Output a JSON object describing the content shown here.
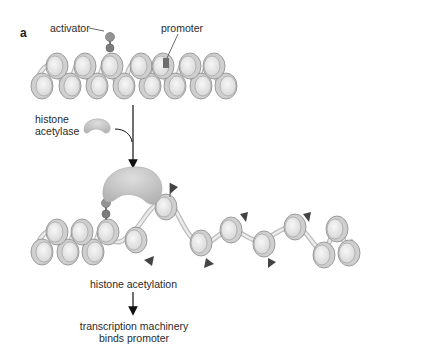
{
  "figure": {
    "panel_label": "a",
    "labels": {
      "activator": "activator",
      "promoter": "promoter",
      "histone_acetylase_line1": "histone",
      "histone_acetylase_line2": "acetylase",
      "histone_acetylation": "histone acetylation",
      "result_line1": "transcription machinery",
      "result_line2": "binds promoter"
    },
    "colors": {
      "nucleosome_fill": "#e6e6e6",
      "nucleosome_edge": "#8a8a8a",
      "activator": "#8e8e8e",
      "promoter": "#6e6e6e",
      "acetylase": "#c4c4c4",
      "acetyl_flag": "#444444",
      "arrow": "#111111"
    },
    "top_row": {
      "state": "condensed chromatin",
      "upper_nucleosomes_x": [
        55,
        83,
        110,
        139,
        161,
        188,
        212
      ],
      "lower_nucleosomes_x": [
        42,
        70,
        97,
        124,
        150,
        175,
        201,
        226
      ],
      "upper_y": 67,
      "lower_y": 86
    },
    "bottom_row": {
      "state": "acetylated, open chromatin",
      "condensed_upper_x": [
        55,
        80,
        106
      ],
      "condensed_lower_x": [
        42,
        68,
        93
      ],
      "open_nucleosomes": [
        {
          "x": 136,
          "y": 229
        },
        {
          "x": 164,
          "y": 201
        },
        {
          "x": 200,
          "y": 243
        },
        {
          "x": 229,
          "y": 230
        },
        {
          "x": 263,
          "y": 240
        },
        {
          "x": 294,
          "y": 226
        },
        {
          "x": 322,
          "y": 250
        },
        {
          "x": 337,
          "y": 226
        },
        {
          "x": 347,
          "y": 253
        }
      ],
      "acetyl_flags": [
        {
          "x": 172,
          "y": 185
        },
        {
          "x": 146,
          "y": 260
        },
        {
          "x": 206,
          "y": 264
        },
        {
          "x": 244,
          "y": 215
        },
        {
          "x": 272,
          "y": 262
        },
        {
          "x": 307,
          "y": 213
        }
      ]
    }
  }
}
